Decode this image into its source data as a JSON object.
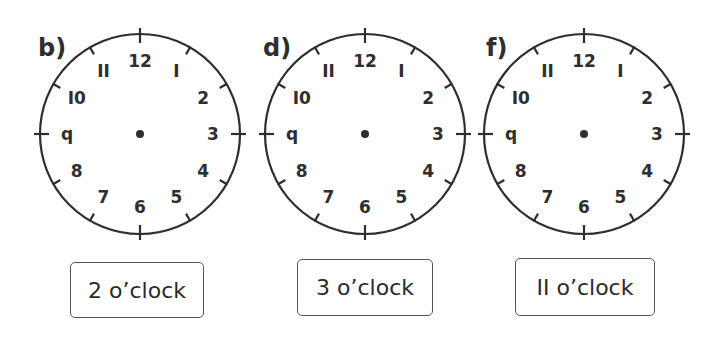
{
  "clocks": [
    {
      "label": "b)",
      "cx": 140,
      "cy": 134,
      "r": 100,
      "label_x": 38,
      "label_y": 36,
      "answer": "2 o’clock",
      "box": {
        "x": 70,
        "y": 262,
        "w": 134,
        "h": 56
      }
    },
    {
      "label": "d)",
      "cx": 365,
      "cy": 134,
      "r": 100,
      "label_x": 263,
      "label_y": 36,
      "answer": "3 o’clock",
      "box": {
        "x": 297,
        "y": 259,
        "w": 136,
        "h": 57
      }
    },
    {
      "label": "f)",
      "cx": 584,
      "cy": 134,
      "r": 100,
      "label_x": 486,
      "label_y": 36,
      "answer": "II o’clock",
      "box": {
        "x": 515,
        "y": 258,
        "w": 140,
        "h": 58
      }
    }
  ],
  "numerals": [
    "12",
    "I",
    "2",
    "3",
    "4",
    "5",
    "6",
    "7",
    "8",
    "q",
    "I0",
    "II"
  ],
  "colors": {
    "stroke": "#2e2e2e",
    "box_border": "#555555"
  }
}
